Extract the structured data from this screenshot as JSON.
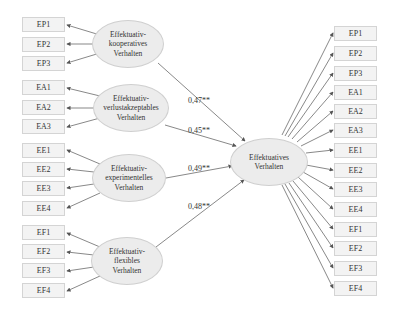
{
  "diagram": {
    "type": "structural-equation-model",
    "central_construct": {
      "label": "Effektuatives\nVerhalten"
    },
    "factors": [
      {
        "id": "kooperativ",
        "label": "Effektuativ-\nkooperatives\nVerhalten",
        "coefficient": "0,47**",
        "indicators": [
          "EP1",
          "EP2",
          "EP3"
        ]
      },
      {
        "id": "verlust",
        "label": "Effektuativ-\nverlustakzeptables\nVerhalten",
        "coefficient": "0,45**",
        "indicators": [
          "EA1",
          "EA2",
          "EA3"
        ]
      },
      {
        "id": "experimentell",
        "label": "Effektuativ-\nexperimentelles\nVerhalten",
        "coefficient": "0,49**",
        "indicators": [
          "EE1",
          "EE2",
          "EE3",
          "EE4"
        ]
      },
      {
        "id": "flexibel",
        "label": "Effektuativ-\nflexibles\nVerhalten",
        "coefficient": "0,48**",
        "indicators": [
          "EF1",
          "EF2",
          "EF3",
          "EF4"
        ]
      }
    ],
    "right_indicators": [
      "EP1",
      "EP2",
      "EP3",
      "EA1",
      "EA2",
      "EA3",
      "EE1",
      "EE2",
      "EE3",
      "EE4",
      "EF1",
      "EF2",
      "EF3",
      "EF4"
    ]
  },
  "colors": {
    "box_fill": "#f3f3f3",
    "ellipse_fill": "#ececec",
    "line": "#555555"
  }
}
